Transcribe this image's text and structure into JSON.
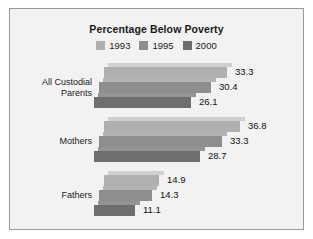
{
  "chart_data": {
    "type": "bar",
    "orientation": "horizontal",
    "title": "Percentage Below Poverty",
    "xlabel": "",
    "ylabel": "",
    "categories": [
      "All Custodial Parents",
      "Mothers",
      "Fathers"
    ],
    "category_lines": [
      [
        "All Custodial",
        "Parents"
      ],
      [
        "Mothers"
      ],
      [
        "Fathers"
      ]
    ],
    "series": [
      {
        "name": "1993",
        "values": [
          33.3,
          36.8,
          14.9
        ],
        "color": "#b0b0b0"
      },
      {
        "name": "1995",
        "values": [
          30.4,
          33.3,
          14.3
        ],
        "color": "#8e8e8e"
      },
      {
        "name": "2000",
        "values": [
          26.1,
          28.7,
          11.1
        ],
        "color": "#6e6e6e"
      }
    ],
    "value_labels": [
      [
        "33.3",
        "30.4",
        "26.1"
      ],
      [
        "36.8",
        "33.3",
        "28.7"
      ],
      [
        "14.9",
        "14.3",
        "11.1"
      ]
    ],
    "xlim": [
      0,
      40
    ],
    "grid": false,
    "legend_position": "top",
    "style_3d": true
  },
  "chart": {
    "title": "Percentage Below Poverty",
    "background": "#f2f2f2",
    "border_color": "#9a9a9a",
    "top_face_colors": [
      "#cfcfcf",
      "#b3b3b3",
      "#949494"
    ]
  },
  "legend": {
    "items": [
      {
        "label": "1993",
        "color": "#b0b0b0"
      },
      {
        "label": "1995",
        "color": "#8e8e8e"
      },
      {
        "label": "2000",
        "color": "#6e6e6e"
      }
    ]
  }
}
